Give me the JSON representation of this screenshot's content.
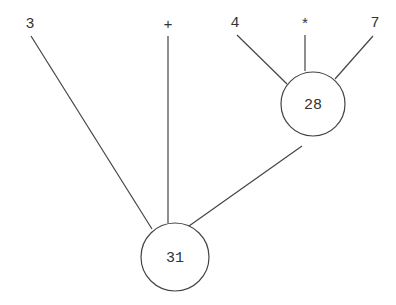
{
  "diagram": {
    "type": "expression-tree",
    "leaves": [
      {
        "id": "leaf-3",
        "label": "3"
      },
      {
        "id": "leaf-plus",
        "label": "+"
      },
      {
        "id": "leaf-4",
        "label": "4"
      },
      {
        "id": "leaf-times",
        "label": "*"
      },
      {
        "id": "leaf-7",
        "label": "7"
      }
    ],
    "nodes": [
      {
        "id": "node-28",
        "label": "28",
        "children": [
          "leaf-4",
          "leaf-times",
          "leaf-7"
        ]
      },
      {
        "id": "node-31",
        "label": "31",
        "children": [
          "leaf-3",
          "leaf-plus",
          "node-28"
        ]
      }
    ],
    "colors": {
      "line": "#444444",
      "text": "#333333",
      "background": "#ffffff"
    }
  }
}
